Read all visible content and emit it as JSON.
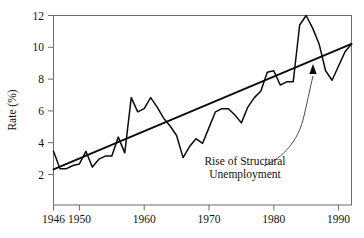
{
  "chart_data": {
    "type": "line",
    "title": "",
    "subtitle": "",
    "xlabel": "",
    "ylabel": "Rate (%)",
    "xlim": [
      1946,
      1992
    ],
    "ylim": [
      0,
      12
    ],
    "grid": false,
    "legend": "none",
    "x_tick_labels": [
      "1946",
      "1950",
      "1960",
      "1970",
      "1980",
      "1990"
    ],
    "x_tick_values": [
      1946,
      1950,
      1960,
      1970,
      1980,
      1990
    ],
    "y_tick_labels": [
      "2",
      "4",
      "6",
      "8",
      "10",
      "12"
    ],
    "y_tick_values": [
      2,
      4,
      6,
      8,
      10,
      12
    ],
    "x": [
      1946,
      1947,
      1948,
      1949,
      1950,
      1951,
      1952,
      1953,
      1954,
      1955,
      1956,
      1957,
      1958,
      1959,
      1960,
      1961,
      1962,
      1963,
      1964,
      1965,
      1966,
      1967,
      1968,
      1969,
      1970,
      1971,
      1972,
      1973,
      1974,
      1975,
      1976,
      1977,
      1978,
      1979,
      1980,
      1981,
      1982,
      1983,
      1984,
      1985,
      1986,
      1987,
      1988,
      1989,
      1990,
      1991,
      1992
    ],
    "series": [
      {
        "name": "Unemployment rate",
        "values": [
          3.4,
          2.3,
          2.3,
          2.5,
          2.6,
          3.4,
          2.4,
          2.9,
          3.1,
          3.1,
          4.3,
          3.3,
          6.8,
          5.9,
          6.1,
          6.8,
          6.2,
          5.5,
          5.0,
          4.4,
          3.0,
          3.7,
          4.2,
          3.9,
          4.9,
          5.9,
          6.1,
          6.1,
          5.7,
          5.2,
          6.2,
          6.8,
          7.2,
          8.4,
          8.5,
          7.6,
          7.8,
          7.8,
          11.4,
          12.0,
          11.2,
          10.2,
          8.5,
          7.9,
          8.8,
          9.7,
          10.2
        ],
        "color": "#0b0b0b"
      },
      {
        "name": "Trend line",
        "values": [
          2.25,
          10.2
        ],
        "x": [
          1946,
          1992
        ],
        "color": "#0b0b0b"
      }
    ],
    "annotations": [
      {
        "name": "rise-of-structural-unemployment",
        "line1": "Rise of Structural",
        "line2": "Unemployment",
        "points_to_x": 1986,
        "points_to_y": 9.2
      }
    ]
  },
  "colors": {
    "background": "#ffffff",
    "ink": "#0b0b0b",
    "frame": "#6b6b6b"
  }
}
